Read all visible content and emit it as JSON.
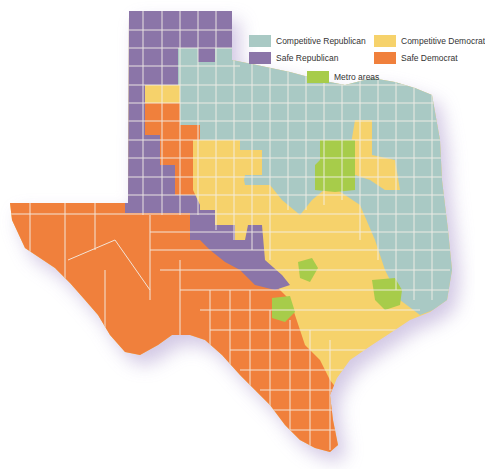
{
  "map": {
    "title": "Texas county political leaning",
    "colors": {
      "competitive_republican": "#a9c9c4",
      "safe_republican": "#8b75a8",
      "competitive_democrat": "#f6d26b",
      "safe_democrat": "#f0803c",
      "metro": "#a7cc4a",
      "border": "#f3efe8",
      "shadow": "#cbbfe0"
    }
  },
  "legend": {
    "items": [
      {
        "key": "competitive_republican",
        "label": "Competitive Republican",
        "color": "#a9c9c4"
      },
      {
        "key": "competitive_democrat",
        "label": "Competitive Democrat",
        "color": "#f6d26b"
      },
      {
        "key": "safe_republican",
        "label": "Safe Republican",
        "color": "#8b75a8"
      },
      {
        "key": "safe_democrat",
        "label": "Safe Democrat",
        "color": "#f0803c"
      },
      {
        "key": "metro",
        "label": "Metro areas",
        "color": "#a7cc4a"
      }
    ]
  }
}
